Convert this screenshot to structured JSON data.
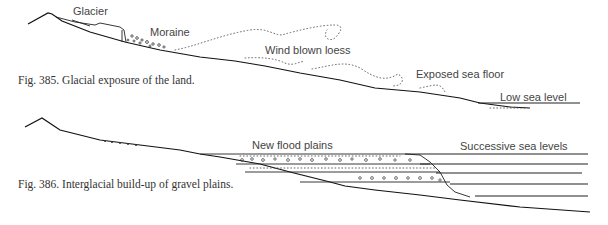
{
  "figures": [
    {
      "number": "Fig. 385.",
      "caption": "Fig. 385. Glacial exposure of the land.",
      "labels": {
        "glacier": "Glacier",
        "moraine": "Moraine",
        "loess": "Wind blown loess",
        "sea_floor": "Exposed sea floor",
        "sea_level": "Low sea level"
      }
    },
    {
      "number": "Fig. 386.",
      "caption": "Fig. 386. Interglacial build-up of gravel plains.",
      "labels": {
        "flood_plains": "New flood plains",
        "sea_levels": "Successive sea levels"
      }
    }
  ]
}
